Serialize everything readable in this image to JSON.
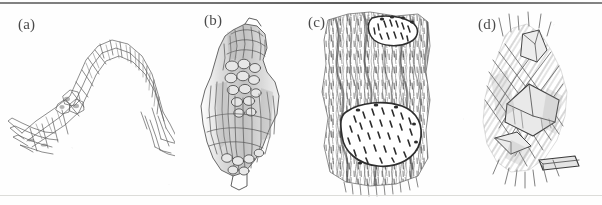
{
  "figure": {
    "kind": "scanned-scientific-figure",
    "background_color": "#fefefe",
    "ink_color": "#3a3a3a",
    "rule_top_color": "#5a5a5a",
    "rule_bottom_color": "#d8d8d5",
    "panel_count": 4,
    "panels": [
      {
        "id": "a",
        "label": "(a)",
        "label_x": 18,
        "label_y": 16,
        "subject": "arched zig-zag bundle of elongated prismatic crystals drawn in line art",
        "ink_density": "light"
      },
      {
        "id": "b",
        "label": "(b)",
        "label_x": 204,
        "label_y": 12,
        "subject": "spindle shaped aggregate with longitudinal fibres and a central band of rounded nodules",
        "ink_density": "medium"
      },
      {
        "id": "c",
        "label": "(c)",
        "label_x": 308,
        "label_y": 14,
        "subject": "dense fibrous matrix with two lens shaped inclusions filled with short dashes",
        "ink_density": "heavy"
      },
      {
        "id": "d",
        "label": "(d)",
        "label_x": 478,
        "label_y": 16,
        "subject": "loose sheaf of overlapping rod and lath shaped crystals",
        "ink_density": "medium"
      }
    ]
  }
}
